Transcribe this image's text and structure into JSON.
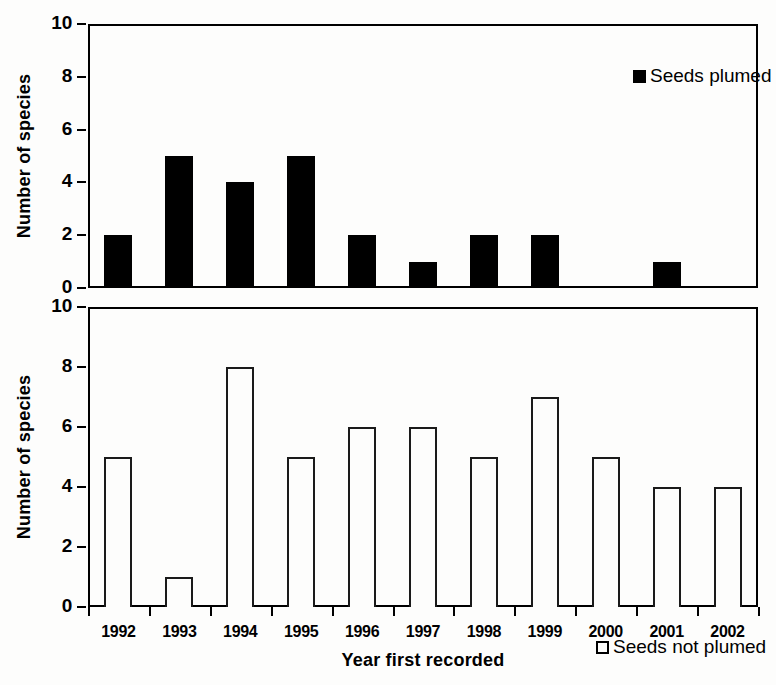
{
  "chart_data": {
    "type": "bar",
    "title": "",
    "xlabel": "Year first recorded",
    "ylabel": "Number of species",
    "categories": [
      "1992",
      "1993",
      "1994",
      "1995",
      "1996",
      "1997",
      "1998",
      "1999",
      "2000",
      "2001",
      "2002"
    ],
    "ylim": [
      0,
      10
    ],
    "yticks": [
      0,
      2,
      4,
      6,
      8,
      10
    ],
    "grid": false,
    "panels": [
      {
        "id": "seeds-plumed",
        "legend": "Seeds plumed",
        "legend_position": "top-right",
        "marker": "filled-square",
        "ylabel": "Number of species",
        "ylim": [
          0,
          10
        ],
        "yticks": [
          0,
          2,
          4,
          6,
          8,
          10
        ],
        "series": [
          {
            "name": "Seeds plumed",
            "values": [
              2,
              5,
              4,
              5,
              2,
              1,
              2,
              2,
              0,
              1,
              0
            ]
          }
        ]
      },
      {
        "id": "seeds-not-plumed",
        "legend": "Seeds not plumed",
        "legend_position": "top-right",
        "marker": "hollow-square",
        "ylabel": "Number of species",
        "ylim": [
          0,
          10
        ],
        "yticks": [
          0,
          2,
          4,
          6,
          8,
          10
        ],
        "series": [
          {
            "name": "Seeds not plumed",
            "values": [
              5,
              1,
              8,
              5,
              6,
              6,
              5,
              7,
              5,
              4,
              4
            ]
          }
        ]
      }
    ]
  },
  "colors": {
    "ink": "#000000",
    "bar_fill": "#000000",
    "bar_outline": "#1a1a1a",
    "background": "#fdfdfc"
  }
}
